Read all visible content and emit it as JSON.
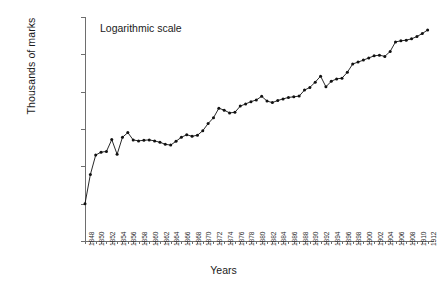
{
  "chart_data": {
    "type": "line",
    "title": "",
    "annotation": "Logarithmic scale",
    "xlabel": "Years",
    "ylabel": "Thousands of marks",
    "scale": "log",
    "grid": false,
    "legend": "none",
    "marker": "filled-circle",
    "line_color": "#111111",
    "axis_color": "#6e6e6e",
    "xlim": [
      1848,
      1913
    ],
    "ylim": [
      1,
      1000000
    ],
    "ytick_labels": [
      "1,000,000",
      "100,000",
      "10,000",
      "1,000",
      "100",
      "10",
      "1"
    ],
    "ytick_values": [
      1000000,
      100000,
      10000,
      1000,
      100,
      10,
      1
    ],
    "xtick_labels": [
      "1848",
      "1850",
      "1852",
      "1854",
      "1856",
      "1858",
      "1860",
      "1862",
      "1864",
      "1866",
      "1868",
      "1870",
      "1872",
      "1874",
      "1876",
      "1878",
      "1880",
      "1882",
      "1884",
      "1886",
      "1888",
      "1890",
      "1892",
      "1894",
      "1896",
      "1898",
      "1900",
      "1902",
      "1904",
      "1906",
      "1908",
      "1910",
      "1912"
    ],
    "xtick_step": 2,
    "minor_ticks_every_year": true,
    "x": [
      1848,
      1849,
      1850,
      1851,
      1852,
      1853,
      1854,
      1855,
      1856,
      1857,
      1858,
      1859,
      1860,
      1861,
      1862,
      1863,
      1864,
      1865,
      1866,
      1867,
      1868,
      1869,
      1870,
      1871,
      1872,
      1873,
      1874,
      1875,
      1876,
      1877,
      1878,
      1879,
      1880,
      1881,
      1882,
      1883,
      1884,
      1885,
      1886,
      1887,
      1888,
      1889,
      1890,
      1891,
      1892,
      1893,
      1894,
      1895,
      1896,
      1897,
      1898,
      1899,
      1900,
      1901,
      1902,
      1903,
      1904,
      1905,
      1906,
      1907,
      1908,
      1909,
      1910,
      1911,
      1912
    ],
    "values": [
      10,
      60,
      200,
      240,
      250,
      520,
      210,
      600,
      800,
      510,
      480,
      500,
      510,
      480,
      440,
      390,
      370,
      470,
      600,
      700,
      640,
      680,
      900,
      1400,
      2000,
      3600,
      3200,
      2700,
      2800,
      4100,
      4700,
      5400,
      6000,
      7500,
      5600,
      5100,
      5800,
      6400,
      7000,
      7300,
      7600,
      11000,
      13000,
      18000,
      26000,
      13500,
      19000,
      22000,
      23000,
      33000,
      55000,
      62000,
      70000,
      80000,
      91000,
      95000,
      88000,
      120000,
      215000,
      230000,
      240000,
      260000,
      300000,
      360000,
      450000
    ],
    "series_name": "Thousands of marks"
  }
}
